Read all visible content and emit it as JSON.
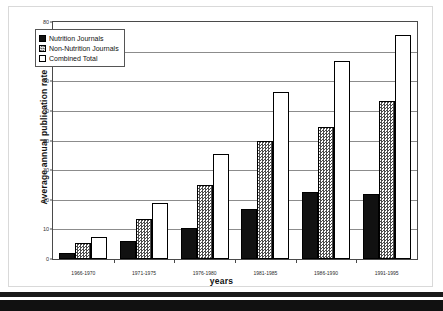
{
  "chart_data": {
    "type": "bar",
    "title": "",
    "xlabel": "years",
    "ylabel": "Average annual publication rate",
    "ylim": [
      0,
      80
    ],
    "ytick_step": 10,
    "yticks": [
      "0",
      "10",
      "20",
      "30",
      "40",
      "50",
      "60",
      "70",
      "80"
    ],
    "grid": true,
    "legend_position": "upper-left-inside",
    "categories": [
      "1966-1970",
      "1971-1975",
      "1976-1980",
      "1981-1985",
      "1986-1990",
      "1991-1995"
    ],
    "series": [
      {
        "name": "Nutrition Journals",
        "swatch": "black-solid",
        "color": "#111111",
        "values": [
          2,
          6,
          10.5,
          17,
          22.5,
          22
        ]
      },
      {
        "name": "Non-Nutrition Journals",
        "swatch": "grey-checker-hatch",
        "color": "#4d4d4d",
        "values": [
          5.5,
          13.5,
          25,
          40,
          44.5,
          53.5
        ]
      },
      {
        "name": "Combined Total",
        "swatch": "white-outline",
        "color": "#ffffff",
        "values": [
          7.5,
          19,
          35.5,
          56.5,
          67,
          75.5
        ]
      }
    ]
  },
  "legend": {
    "items": [
      {
        "label": "Nutrition Journals"
      },
      {
        "label": "Non-Nutrition Journals"
      },
      {
        "label": "Combined Total"
      }
    ]
  },
  "axes": {
    "y_title": "Average annual publication rate",
    "x_title": "years"
  },
  "colors": {
    "plot_border": "#4a4a4a",
    "gridline": "#8c8c8c",
    "bar_nutrition": "#111111",
    "bar_nonnutrition_hatch": "#4d4d4d",
    "bar_combined": "#ffffff"
  }
}
